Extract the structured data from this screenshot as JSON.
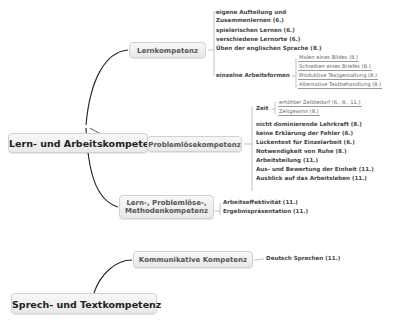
{
  "map": {
    "roots": [
      {
        "label": "Lern- und Arbeitskompetenz",
        "collapse_indicator": "…",
        "branches": [
          {
            "label": "Lernkompetenz",
            "items": [
              "eigene Aufteilung und",
              "Zusammenlernen (6.)",
              "spielerischen Lernen (6.)",
              "verschiedene Lernorte (6.)",
              "Üben der englischen Sprache (8.)",
              "einzelne Arbeitsformen"
            ],
            "subitems": [
              "Malen eines Bildes (8.)",
              "Schreiben eines Briefes (8.)",
              "Produktive Textgestaltung (8.)",
              "Alternative Textbehandlung (8.)"
            ]
          },
          {
            "label": "Problemlösekompetenz",
            "items": [
              "Zeit",
              "nicht dominierende Lehrkraft (8.)",
              "keine Erklärung der Fehler (6.)",
              "Lückentext für Einzelarbeit (6.)",
              "Notwendigkeit von Ruhe (8.)",
              "Arbeitsteilung (11.)",
              "Aus- und Bewertung der Einheit (11.)",
              "Ausblick auf das Arbeitsleben (11.)"
            ],
            "subitems": [
              "erhöhter Zeitbedarf (6., 8., 11.)",
              "Zeitgewinn (8.)"
            ]
          },
          {
            "label_line1": "Lern-, Problemlöse-,",
            "label_line2": "Methodenkompetenz",
            "items": [
              "Arbeitseffektivität (11.)",
              "Ergebnispräsentation (11.)"
            ]
          }
        ]
      },
      {
        "label": "Sprech- und Textkompetenz",
        "collapse_indicator": "…",
        "branches": [
          {
            "label": "Kommunikative Kompetenz",
            "items": [
              "Deutsch Sprechen (11.)"
            ]
          }
        ]
      }
    ]
  }
}
